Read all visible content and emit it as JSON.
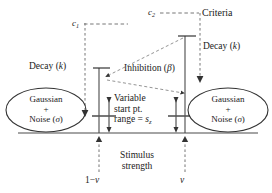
{
  "diagram": {
    "colors": {
      "ink": "#1a1a1a",
      "line": "#555555",
      "dashed": "#777777",
      "background": "#ffffff"
    },
    "criteria": {
      "c1_label": "c",
      "c1_sub": "1",
      "c2_label": "c",
      "c2_sub": "2",
      "criteria_label": "Criteria"
    },
    "decay": {
      "left_label": "Decay (",
      "left_param": "k",
      "left_close": ")",
      "right_label": "Decay (",
      "right_param": "k",
      "right_close": ")"
    },
    "inhibition": {
      "label": "Inhibition (",
      "param": "β",
      "close": ")"
    },
    "start_point": {
      "line1": "Variable",
      "line2": "start pt.",
      "line3_prefix": "range = ",
      "line3_var": "s",
      "line3_sub": "z"
    },
    "axis": {
      "line1": "Stimulus",
      "line2": "strength"
    },
    "drift": {
      "left": "1−",
      "left_var": "v",
      "right_var": "v"
    },
    "accumulator_left": {
      "noise_line1": "Gaussian",
      "noise_line2": "+",
      "noise_line3_prefix": "Noise (",
      "noise_line3_var": "σ",
      "noise_line3_close": ")"
    },
    "accumulator_right": {
      "noise_line1": "Gaussian",
      "noise_line2": "+",
      "noise_line3_prefix": "Noise (",
      "noise_line3_var": "σ",
      "noise_line3_close": ")"
    }
  }
}
